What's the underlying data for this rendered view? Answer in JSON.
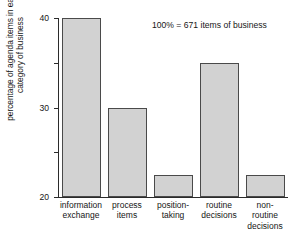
{
  "chart_data": {
    "type": "bar",
    "title": "",
    "subtitle": "",
    "xlabel": "",
    "ylabel_lines": [
      "percentage of agenda items in each",
      "category of business"
    ],
    "ylabel": "percentage of agenda items in each category of business",
    "ylim": [
      0,
      40
    ],
    "yticks": [
      0,
      10,
      20,
      30,
      40
    ],
    "ytick_labels": [
      "0",
      "10",
      "20",
      "30",
      "40"
    ],
    "grid": false,
    "legend": "none",
    "annotation": "100% = 671 items of business",
    "bar_fill_color": "#d2d2d2",
    "bar_edge_color": "#4a4a4a",
    "axis_color": "#2b2b2b",
    "categories": [
      "information exchange",
      "process items",
      "position-taking",
      "routine decisions",
      "non-routine decisions"
    ],
    "category_label_lines": [
      [
        "information",
        "exchange"
      ],
      [
        "process",
        "items"
      ],
      [
        "position-",
        "taking"
      ],
      [
        "routine",
        "decisions"
      ],
      [
        "non-",
        "routine",
        "decisions"
      ]
    ],
    "values": [
      40,
      20,
      5,
      30,
      5
    ]
  }
}
